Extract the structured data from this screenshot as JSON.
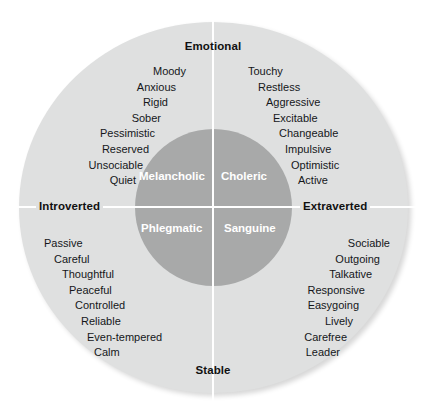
{
  "diagram": {
    "colors": {
      "outer_circle": "#dfe0e0",
      "inner_circle": "#a8a9a9",
      "divider_line": "#ffffff",
      "text": "#15171a",
      "temperament_text": "#ffffff",
      "background": "#ffffff"
    },
    "axes": {
      "top_label": "Emotional",
      "bottom_label": "Stable",
      "left_label": "Introverted",
      "right_label": "Extraverted"
    },
    "quadrants": [
      {
        "name": "Melancholic",
        "position": "top-left",
        "traits": [
          "Moody",
          "Anxious",
          "Rigid",
          "Sober",
          "Pessimistic",
          "Reserved",
          "Unsociable",
          "Quiet"
        ]
      },
      {
        "name": "Choleric",
        "position": "top-right",
        "traits": [
          "Touchy",
          "Restless",
          "Aggressive",
          "Excitable",
          "Changeable",
          "Impulsive",
          "Optimistic",
          "Active"
        ]
      },
      {
        "name": "Phlegmatic",
        "position": "bottom-left",
        "traits": [
          "Passive",
          "Careful",
          "Thoughtful",
          "Peaceful",
          "Controlled",
          "Reliable",
          "Even-tempered",
          "Calm"
        ]
      },
      {
        "name": "Sanguine",
        "position": "bottom-right",
        "traits": [
          "Sociable",
          "Outgoing",
          "Talkative",
          "Responsive",
          "Easygoing",
          "Lively",
          "Carefree",
          "Leader"
        ]
      }
    ]
  }
}
